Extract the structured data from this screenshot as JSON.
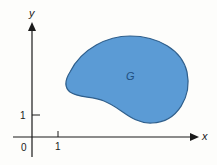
{
  "diagram": {
    "type": "region-in-plane",
    "axes": {
      "x_label": "x",
      "y_label": "y",
      "origin_label": "0",
      "x_tick_label": "1",
      "y_tick_label": "1"
    },
    "region": {
      "label": "G",
      "fill_color": "#5b9bd5",
      "stroke_color": "#2f5f8c"
    },
    "axis_color": "#1a1a1a"
  }
}
